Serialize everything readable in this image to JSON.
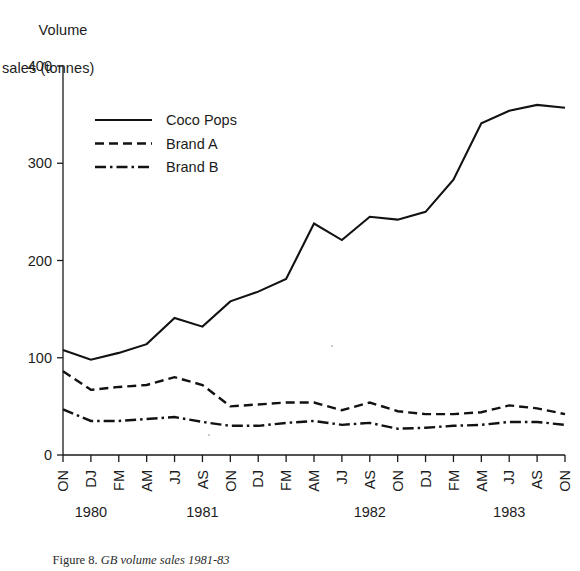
{
  "axis_title": {
    "line1": "Volume",
    "line2": "sales (tonnes)"
  },
  "caption": {
    "prefix": "Figure 8. ",
    "italic": "GB volume sales 1981-83"
  },
  "legend": {
    "position": "inside-top-left",
    "items": [
      {
        "label": "Coco Pops",
        "style": "solid",
        "color": "#121212"
      },
      {
        "label": "Brand A",
        "style": "dashed",
        "color": "#121212"
      },
      {
        "label": "Brand B",
        "style": "dashdot",
        "color": "#121212"
      }
    ]
  },
  "chart_data": {
    "type": "line",
    "title": "",
    "subtitle": "",
    "xlabel": "",
    "ylabel": "Volume sales (tonnes)",
    "ylim": [
      0,
      400
    ],
    "yticks": [
      0,
      100,
      200,
      300,
      400
    ],
    "ytick_labels": [
      "0",
      "100",
      "200",
      "300",
      "400"
    ],
    "grid": false,
    "legend_position": "inside-top-left",
    "x": [
      "ON",
      "DJ",
      "FM",
      "AM",
      "JJ",
      "AS",
      "ON",
      "DJ",
      "FM",
      "AM",
      "JJ",
      "AS",
      "ON",
      "DJ",
      "FM",
      "AM",
      "JJ",
      "AS",
      "ON"
    ],
    "xtick_labels": [
      "ON",
      "DJ",
      "FM",
      "AM",
      "JJ",
      "AS",
      "ON",
      "DJ",
      "FM",
      "AM",
      "JJ",
      "AS",
      "ON",
      "DJ",
      "FM",
      "AM",
      "JJ",
      "AS",
      "ON"
    ],
    "year_groups": [
      {
        "label": "1980",
        "start_index": 0,
        "end_index": 2
      },
      {
        "label": "1981",
        "start_index": 2,
        "end_index": 8
      },
      {
        "label": "1982",
        "start_index": 8,
        "end_index": 14
      },
      {
        "label": "1983",
        "start_index": 14,
        "end_index": 18
      }
    ],
    "series": [
      {
        "name": "Coco Pops",
        "style": "solid",
        "values": [
          108,
          98,
          105,
          114,
          141,
          132,
          158,
          168,
          181,
          238,
          221,
          245,
          242,
          250,
          283,
          341,
          354,
          360,
          357
        ]
      },
      {
        "name": "Brand A",
        "style": "dashed",
        "values": [
          86,
          67,
          70,
          72,
          80,
          72,
          50,
          52,
          54,
          54,
          46,
          54,
          45,
          42,
          42,
          44,
          51,
          48,
          42
        ]
      },
      {
        "name": "Brand B",
        "style": "dashdot",
        "values": [
          47,
          35,
          35,
          37,
          39,
          34,
          30,
          30,
          33,
          35,
          31,
          33,
          27,
          28,
          30,
          31,
          34,
          34,
          31
        ]
      }
    ]
  }
}
